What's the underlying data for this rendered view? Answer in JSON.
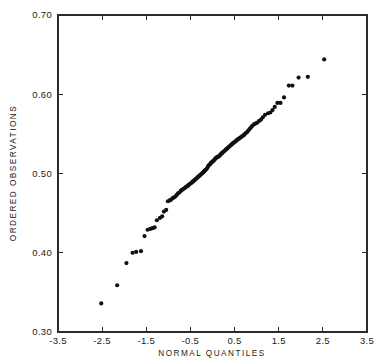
{
  "chart_data": {
    "type": "scatter",
    "title": "",
    "xlabel": "NORMAL QUANTILES",
    "ylabel": "ORDERED OBSERVATIONS",
    "xlim": [
      -3.5,
      3.5
    ],
    "ylim": [
      0.3,
      0.7
    ],
    "xticks": [
      -3.5,
      -2.5,
      -1.5,
      -0.5,
      0.5,
      1.5,
      2.5,
      3.5
    ],
    "yticks": [
      0.3,
      0.4,
      0.5,
      0.6,
      0.7
    ],
    "xtick_labels": [
      "-3.5",
      "-2.5",
      "-1.5",
      "-0.5",
      "0.5",
      "1.5",
      "2.5",
      "3.5"
    ],
    "ytick_labels": [
      "0.30",
      "0.40",
      "0.50",
      "0.60",
      "0.70"
    ],
    "grid": false,
    "legend": false,
    "frame": "box",
    "tick_direction": "in",
    "marker": "filled-circle",
    "marker_size": 2.1,
    "marker_color": "#111111",
    "series": [
      {
        "name": "ordered observations",
        "x": [
          -2.52,
          -2.16,
          -1.95,
          -1.81,
          -1.73,
          -1.62,
          -1.54,
          -1.47,
          -1.41,
          -1.36,
          -1.31,
          -1.26,
          -1.19,
          -1.14,
          -1.1,
          -1.05,
          -1.01,
          -0.97,
          -0.94,
          -0.9,
          -0.87,
          -0.84,
          -0.81,
          -0.78,
          -0.75,
          -0.72,
          -0.7,
          -0.67,
          -0.65,
          -0.62,
          -0.6,
          -0.57,
          -0.55,
          -0.53,
          -0.51,
          -0.48,
          -0.46,
          -0.44,
          -0.42,
          -0.4,
          -0.38,
          -0.36,
          -0.34,
          -0.32,
          -0.3,
          -0.28,
          -0.26,
          -0.24,
          -0.22,
          -0.2,
          -0.18,
          -0.17,
          -0.15,
          -0.13,
          -0.11,
          -0.09,
          -0.07,
          -0.05,
          -0.04,
          -0.02,
          0.0,
          0.02,
          0.04,
          0.05,
          0.07,
          0.09,
          0.11,
          0.13,
          0.15,
          0.17,
          0.18,
          0.2,
          0.22,
          0.24,
          0.26,
          0.28,
          0.3,
          0.32,
          0.34,
          0.36,
          0.38,
          0.4,
          0.42,
          0.44,
          0.46,
          0.48,
          0.51,
          0.53,
          0.55,
          0.57,
          0.6,
          0.62,
          0.65,
          0.67,
          0.7,
          0.72,
          0.75,
          0.78,
          0.81,
          0.84,
          0.87,
          0.9,
          0.94,
          0.97,
          1.01,
          1.05,
          1.1,
          1.14,
          1.19,
          1.26,
          1.31,
          1.36,
          1.41,
          1.47,
          1.54,
          1.62,
          1.73,
          1.81,
          1.95,
          2.16,
          2.53
        ],
        "y": [
          0.336,
          0.359,
          0.387,
          0.4,
          0.401,
          0.402,
          0.421,
          0.429,
          0.43,
          0.431,
          0.432,
          0.441,
          0.444,
          0.446,
          0.452,
          0.454,
          0.465,
          0.466,
          0.467,
          0.469,
          0.47,
          0.471,
          0.473,
          0.475,
          0.476,
          0.478,
          0.479,
          0.48,
          0.481,
          0.482,
          0.483,
          0.484,
          0.485,
          0.486,
          0.487,
          0.488,
          0.489,
          0.49,
          0.491,
          0.492,
          0.493,
          0.494,
          0.495,
          0.496,
          0.497,
          0.498,
          0.499,
          0.5,
          0.501,
          0.502,
          0.503,
          0.504,
          0.505,
          0.506,
          0.508,
          0.51,
          0.511,
          0.512,
          0.513,
          0.514,
          0.515,
          0.516,
          0.517,
          0.518,
          0.519,
          0.52,
          0.521,
          0.521,
          0.522,
          0.523,
          0.524,
          0.525,
          0.526,
          0.527,
          0.528,
          0.529,
          0.53,
          0.531,
          0.532,
          0.533,
          0.534,
          0.535,
          0.536,
          0.537,
          0.538,
          0.539,
          0.54,
          0.541,
          0.542,
          0.543,
          0.544,
          0.545,
          0.546,
          0.547,
          0.548,
          0.549,
          0.551,
          0.552,
          0.554,
          0.556,
          0.558,
          0.56,
          0.562,
          0.563,
          0.564,
          0.566,
          0.568,
          0.571,
          0.574,
          0.576,
          0.577,
          0.58,
          0.584,
          0.589,
          0.589,
          0.596,
          0.611,
          0.611,
          0.621,
          0.622,
          0.644
        ]
      }
    ]
  },
  "axes": {
    "x_title": "NORMAL QUANTILES",
    "y_title": "ORDERED OBSERVATIONS"
  }
}
